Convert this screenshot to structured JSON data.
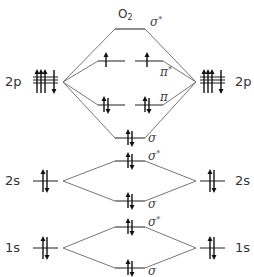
{
  "diagram": {
    "title": "O",
    "title_subscript": "2",
    "colors": {
      "level": "#444444",
      "connector": "#777777",
      "arrow": "#111111",
      "text": "#333333"
    },
    "atomic_orbitals": [
      {
        "label": "2p",
        "side": "left",
        "electrons": [
          "up",
          "up",
          "up",
          "down"
        ]
      },
      {
        "label": "2p",
        "side": "right",
        "electrons": [
          "up",
          "up",
          "up",
          "down"
        ]
      },
      {
        "label": "2s",
        "side": "left",
        "electrons": [
          "up",
          "down"
        ]
      },
      {
        "label": "2s",
        "side": "right",
        "electrons": [
          "up",
          "down"
        ]
      },
      {
        "label": "1s",
        "side": "left",
        "electrons": [
          "up",
          "down"
        ]
      },
      {
        "label": "1s",
        "side": "right",
        "electrons": [
          "up",
          "down"
        ]
      }
    ],
    "molecular_orbitals": [
      {
        "shell": "2p",
        "label": "σ",
        "star": "*",
        "electrons": []
      },
      {
        "shell": "2p",
        "label": "π",
        "star": "*",
        "electrons": [
          [
            "up"
          ],
          [
            "up"
          ]
        ]
      },
      {
        "shell": "2p",
        "label": "π",
        "star": "",
        "electrons": [
          [
            "up",
            "down"
          ],
          [
            "up",
            "down"
          ]
        ]
      },
      {
        "shell": "2p",
        "label": "σ",
        "star": "",
        "electrons": [
          "up",
          "down"
        ]
      },
      {
        "shell": "2s",
        "label": "σ",
        "star": "*",
        "electrons": [
          "up",
          "down"
        ]
      },
      {
        "shell": "2s",
        "label": "σ",
        "star": "",
        "electrons": [
          "up",
          "down"
        ]
      },
      {
        "shell": "1s",
        "label": "σ",
        "star": "*",
        "electrons": [
          "up",
          "down"
        ]
      },
      {
        "shell": "1s",
        "label": "σ",
        "star": "",
        "electrons": [
          "up",
          "down"
        ]
      }
    ]
  }
}
